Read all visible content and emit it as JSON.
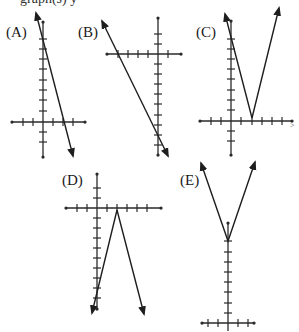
{
  "header": {
    "cropped_text": "graph(s) y"
  },
  "options": [
    {
      "label": "(A)",
      "type": "line",
      "description": "Line with negative slope crossing positive y-axis and positive x-axis"
    },
    {
      "label": "(B)",
      "type": "line",
      "description": "Line with negative slope crossing negative x-axis and negative y-axis"
    },
    {
      "label": "(C)",
      "type": "absolute-value-v-up",
      "description": "V-shape opening upward with vertex on positive x-axis"
    },
    {
      "label": "(D)",
      "type": "absolute-value-v-down",
      "description": "Inverted V opening downward with vertex on positive x-axis"
    },
    {
      "label": "(E)",
      "type": "absolute-value-v-up",
      "description": "V-shape opening upward with vertex on positive y-axis"
    }
  ],
  "stray_mark": ">"
}
